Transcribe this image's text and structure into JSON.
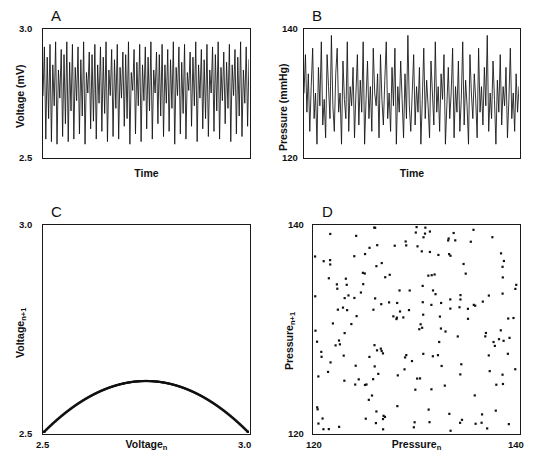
{
  "figure": {
    "panels": [
      {
        "id": "A",
        "letter": "A",
        "type": "line",
        "xlabel": "Time",
        "ylabel": "Voltage (mV)",
        "ylabel_text": "Voltage (mV)",
        "ytick_top": "3.0",
        "ytick_bottom": "2.5",
        "ylim": [
          2.5,
          3.0
        ],
        "xticks": []
      },
      {
        "id": "B",
        "letter": "B",
        "type": "line",
        "xlabel": "Time",
        "ylabel": "Pressure (mmHg)",
        "ylabel_text": "Pressure (mmHg)",
        "ytick_top": "140",
        "ytick_bottom": "120",
        "ylim": [
          120,
          140
        ],
        "xticks": []
      },
      {
        "id": "C",
        "letter": "C",
        "type": "scatter",
        "xlabel_main": "Voltage",
        "xlabel_sub": "n",
        "ylabel_main": "Voltage",
        "ylabel_sub": "n+1",
        "ytick_top": "3.0",
        "ytick_bottom": "2.5",
        "xtick_left": "2.5",
        "xtick_right": "3.0",
        "xlim": [
          2.5,
          3.0
        ],
        "ylim": [
          2.5,
          3.0
        ]
      },
      {
        "id": "D",
        "letter": "D",
        "type": "scatter",
        "xlabel_main": "Pressure",
        "xlabel_sub": "n",
        "ylabel_main": "Pressure",
        "ylabel_sub": "n+1",
        "ytick_top": "140",
        "ytick_bottom": "120",
        "xtick_left": "120",
        "xtick_right": "140",
        "xlim": [
          120,
          140
        ],
        "ylim": [
          120,
          140
        ]
      }
    ]
  },
  "chart_data": [
    {
      "type": "line",
      "panel": "A",
      "title": "A",
      "xlabel": "Time",
      "ylabel": "Voltage (mV)",
      "ylim": [
        2.5,
        3.0
      ],
      "grid": false,
      "legend": "none",
      "description": "Deterministic chaotic voltage time series (logistic-map-like), oscillating irregularly between about 2.55 and 2.96 mV.",
      "x": [
        0,
        1,
        2,
        3,
        4,
        5,
        6,
        7,
        8,
        9,
        10,
        11,
        12,
        13,
        14,
        15,
        16,
        17,
        18,
        19,
        20,
        21,
        22,
        23,
        24,
        25,
        26,
        27,
        28,
        29,
        30,
        31,
        32,
        33,
        34,
        35,
        36,
        37,
        38,
        39,
        40,
        41,
        42,
        43,
        44,
        45,
        46,
        47,
        48,
        49,
        50,
        51,
        52,
        53,
        54,
        55,
        56,
        57,
        58,
        59,
        60,
        61,
        62,
        63,
        64,
        65,
        66,
        67,
        68,
        69,
        70,
        71,
        72,
        73,
        74,
        75,
        76,
        77,
        78,
        79,
        80,
        81,
        82,
        83,
        84,
        85,
        86,
        87,
        88,
        89,
        90,
        91,
        92,
        93,
        94,
        95,
        96,
        97,
        98,
        99,
        100,
        101,
        102,
        103,
        104,
        105,
        106,
        107,
        108,
        109,
        110,
        111,
        112,
        113,
        114,
        115,
        116,
        117,
        118,
        119,
        120,
        121,
        122,
        123,
        124,
        125,
        126,
        127,
        128,
        129,
        130,
        131,
        132,
        133,
        134,
        135,
        136,
        137,
        138,
        139,
        140,
        141,
        142,
        143,
        144,
        145,
        146,
        147,
        148,
        149
      ],
      "y": [
        2.74,
        2.93,
        2.57,
        2.89,
        2.65,
        2.94,
        2.56,
        2.86,
        2.7,
        2.95,
        2.55,
        2.84,
        2.73,
        2.92,
        2.58,
        2.9,
        2.63,
        2.95,
        2.56,
        2.87,
        2.68,
        2.94,
        2.57,
        2.85,
        2.72,
        2.93,
        2.59,
        2.88,
        2.66,
        2.95,
        2.55,
        2.83,
        2.75,
        2.91,
        2.61,
        2.9,
        2.64,
        2.94,
        2.57,
        2.86,
        2.71,
        2.93,
        2.6,
        2.89,
        2.67,
        2.95,
        2.56,
        2.84,
        2.74,
        2.92,
        2.58,
        2.88,
        2.69,
        2.94,
        2.57,
        2.85,
        2.73,
        2.91,
        2.62,
        2.9,
        2.65,
        2.95,
        2.55,
        2.83,
        2.76,
        2.92,
        2.59,
        2.87,
        2.7,
        2.94,
        2.56,
        2.86,
        2.72,
        2.93,
        2.61,
        2.89,
        2.68,
        2.95,
        2.57,
        2.84,
        2.75,
        2.91,
        2.63,
        2.9,
        2.66,
        2.94,
        2.58,
        2.86,
        2.71,
        2.92,
        2.6,
        2.88,
        2.69,
        2.95,
        2.55,
        2.85,
        2.74,
        2.93,
        2.59,
        2.87,
        2.67,
        2.94,
        2.57,
        2.83,
        2.76,
        2.91,
        2.62,
        2.89,
        2.7,
        2.95,
        2.56,
        2.86,
        2.73,
        2.92,
        2.61,
        2.88,
        2.65,
        2.94,
        2.58,
        2.84,
        2.75,
        2.93,
        2.6,
        2.9,
        2.68,
        2.95,
        2.57,
        2.85,
        2.72,
        2.91,
        2.63,
        2.87,
        2.69,
        2.94,
        2.56,
        2.86,
        2.74,
        2.92,
        2.59,
        2.89,
        2.66,
        2.95,
        2.58,
        2.84,
        2.71,
        2.93,
        2.62,
        2.88
      ]
    },
    {
      "type": "line",
      "panel": "B",
      "title": "B",
      "xlabel": "Time",
      "ylabel": "Pressure (mmHg)",
      "ylim": [
        120,
        140
      ],
      "grid": false,
      "legend": "none",
      "description": "Random (stochastic) pressure time series fluctuating irregularly between about 121 and 139 mmHg.",
      "x": [
        0,
        1,
        2,
        3,
        4,
        5,
        6,
        7,
        8,
        9,
        10,
        11,
        12,
        13,
        14,
        15,
        16,
        17,
        18,
        19,
        20,
        21,
        22,
        23,
        24,
        25,
        26,
        27,
        28,
        29,
        30,
        31,
        32,
        33,
        34,
        35,
        36,
        37,
        38,
        39,
        40,
        41,
        42,
        43,
        44,
        45,
        46,
        47,
        48,
        49,
        50,
        51,
        52,
        53,
        54,
        55,
        56,
        57,
        58,
        59,
        60,
        61,
        62,
        63,
        64,
        65,
        66,
        67,
        68,
        69,
        70,
        71,
        72,
        73,
        74,
        75,
        76,
        77,
        78,
        79,
        80,
        81,
        82,
        83,
        84,
        85,
        86,
        87,
        88,
        89,
        90,
        91,
        92,
        93,
        94,
        95,
        96,
        97,
        98,
        99,
        100,
        101,
        102,
        103,
        104,
        105,
        106,
        107,
        108,
        109,
        110,
        111,
        112,
        113,
        114,
        115,
        116,
        117,
        118,
        119,
        120,
        121,
        122,
        123,
        124,
        125,
        126,
        127,
        128,
        129,
        130,
        131,
        132,
        133,
        134,
        135,
        136,
        137,
        138,
        139,
        140,
        141,
        142,
        143,
        144,
        145,
        146,
        147,
        148,
        149
      ],
      "y": [
        130,
        136,
        127,
        133,
        124,
        131,
        137,
        126,
        130,
        122,
        134,
        128,
        138,
        125,
        129,
        123,
        136,
        131,
        126,
        139,
        128,
        124,
        133,
        137,
        127,
        130,
        122,
        135,
        129,
        126,
        138,
        124,
        131,
        128,
        134,
        123,
        130,
        136,
        125,
        132,
        127,
        138,
        122,
        129,
        135,
        126,
        131,
        124,
        137,
        130,
        128,
        133,
        123,
        136,
        129,
        125,
        132,
        138,
        126,
        130,
        124,
        134,
        128,
        137,
        122,
        131,
        127,
        135,
        129,
        123,
        133,
        126,
        139,
        128,
        124,
        130,
        136,
        125,
        131,
        127,
        134,
        122,
        129,
        137,
        126,
        132,
        128,
        123,
        135,
        130,
        125,
        138,
        127,
        131,
        124,
        133,
        129,
        136,
        122,
        128,
        134,
        126,
        130,
        137,
        123,
        131,
        127,
        135,
        124,
        129,
        138,
        125,
        132,
        128,
        122,
        136,
        130,
        126,
        133,
        129,
        123,
        137,
        127,
        131,
        125,
        134,
        128,
        139,
        124,
        130,
        126,
        135,
        129,
        122,
        132,
        127,
        136,
        125,
        131,
        128,
        134,
        123,
        129,
        137,
        126,
        130,
        124,
        133,
        127,
        131
      ]
    },
    {
      "type": "scatter",
      "panel": "C",
      "title": "C",
      "xlabel": "Voltage n",
      "ylabel": "Voltage n+1",
      "xlim": [
        2.5,
        3.0
      ],
      "ylim": [
        2.5,
        3.0
      ],
      "grid": false,
      "legend": "none",
      "description": "First-return map of the Panel A voltage series. Points fall on a smooth inverted parabola peaking at 3.0, revealing deterministic chaos (quadratic/logistic map structure).",
      "relation": "V(n+1) = 2.5 + 2.0*(V(n)-2.5)*(3.0-V(n))"
    },
    {
      "type": "scatter",
      "panel": "D",
      "title": "D",
      "xlabel": "Pressure n",
      "ylabel": "Pressure n+1",
      "xlim": [
        120,
        140
      ],
      "ylim": [
        120,
        140
      ],
      "grid": false,
      "legend": "none",
      "n_points": 200,
      "description": "First-return map of the Panel B pressure series. Points are scattered uniformly with no structure, indicating random (non-deterministic) fluctuation."
    }
  ]
}
